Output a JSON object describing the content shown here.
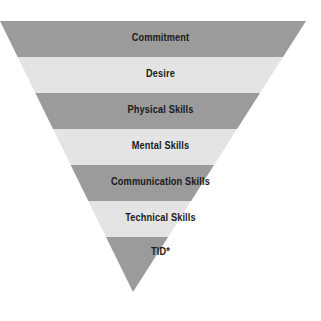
{
  "figure": {
    "name": "inverted-pyramid",
    "title": "",
    "background_color": "#ffffff",
    "apex": {
      "x": 133,
      "y": 292
    },
    "top_left": {
      "x": 0,
      "y": 21
    },
    "top_right": {
      "x": 306,
      "y": 21
    },
    "colors": {
      "dark_band": "#9a9b9a",
      "light_band": "#e3e4e3",
      "text": "#1a1a1a"
    },
    "bands": [
      {
        "label": "Commitment",
        "tone": "dark",
        "color": "#9a9b9a",
        "y_top": 21,
        "y_bottom": 57,
        "label_y": 33
      },
      {
        "label": "Desire",
        "tone": "light",
        "color": "#e3e4e3",
        "y_top": 57,
        "y_bottom": 93,
        "label_y": 69
      },
      {
        "label": "Physical Skills",
        "tone": "dark",
        "color": "#9a9b9a",
        "y_top": 93,
        "y_bottom": 129,
        "label_y": 105
      },
      {
        "label": "Mental Skills",
        "tone": "light",
        "color": "#e3e4e3",
        "y_top": 129,
        "y_bottom": 165,
        "label_y": 141
      },
      {
        "label": "Communication Skills",
        "tone": "dark",
        "color": "#9a9b9a",
        "y_top": 165,
        "y_bottom": 201,
        "label_y": 177
      },
      {
        "label": "Technical Skills",
        "tone": "light",
        "color": "#e3e4e3",
        "y_top": 201,
        "y_bottom": 237,
        "label_y": 213
      },
      {
        "label": "TID*",
        "tone": "dark",
        "color": "#9a9b9a",
        "y_top": 237,
        "y_bottom": 292,
        "label_y": 247
      }
    ]
  }
}
